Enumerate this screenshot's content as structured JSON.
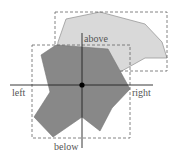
{
  "diagram": {
    "type": "bounding-box-relations",
    "labels": {
      "above": "above",
      "below": "below",
      "left": "left",
      "right": "right"
    },
    "shapes": [
      {
        "name": "upper-polygon",
        "fill": "#d9d9d9",
        "stroke": "#888888",
        "description": "light gray polygon positioned above"
      },
      {
        "name": "reference-polygon",
        "fill": "#888888",
        "stroke": "#777777",
        "description": "dark gray reference polygon"
      }
    ],
    "colors": {
      "axis": "#222222",
      "bbox": "#666666",
      "center_point": "#000000"
    }
  }
}
